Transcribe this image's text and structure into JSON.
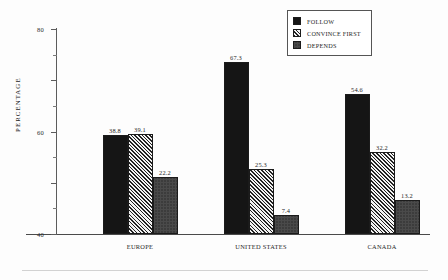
{
  "chart_data": {
    "type": "bar",
    "title": "",
    "subtitle": "",
    "xlabel": "",
    "ylabel": "PERCENTAGE",
    "categories": [
      "EUROPE",
      "UNITED STATES",
      "CANADA"
    ],
    "series": [
      {
        "name": "FOLLOW",
        "fill": "solid",
        "values": [
          38.8,
          67.3,
          54.6
        ]
      },
      {
        "name": "CONVINCE FIRST",
        "fill": "hatch",
        "values": [
          39.1,
          25.3,
          32.2
        ]
      },
      {
        "name": "DEPENDS",
        "fill": "stipple",
        "values": [
          22.2,
          7.4,
          13.2
        ]
      }
    ],
    "ylim": [
      0,
      80
    ],
    "yticks": [
      0,
      20,
      40,
      60,
      80
    ],
    "ytick_labels": [
      "0",
      "20",
      "40",
      "60",
      "80"
    ],
    "yminor_ticks": [
      10,
      30,
      50,
      70
    ],
    "grid": false,
    "legend_position": "top-right",
    "data_labels": true,
    "data_labels_text": [
      [
        "38.8",
        "39.1",
        "22.2"
      ],
      [
        "67.3",
        "25.3",
        "7.4"
      ],
      [
        "54.6",
        "32.2",
        "13.2"
      ]
    ],
    "colors": {
      "series_follow": "#151515",
      "series_convince_first": "#f2f2f2",
      "series_depends": "#4a4a4a",
      "axis": "#4a4a4a",
      "background": "#fdfdfd"
    }
  },
  "legend": {
    "items": [
      {
        "label": "FOLLOW",
        "swatch": "solid-black-swatch"
      },
      {
        "label": "CONVINCE FIRST",
        "swatch": "diagonal-hatch-swatch"
      },
      {
        "label": "DEPENDS",
        "swatch": "stipple-swatch"
      }
    ]
  },
  "axes": {
    "y_title": "PERCENTAGE",
    "y_tick_labels": [
      "80",
      "60",
      "40",
      "20",
      "0"
    ],
    "x_tick_labels": [
      "EUROPE",
      "UNITED STATES",
      "CANADA"
    ]
  }
}
